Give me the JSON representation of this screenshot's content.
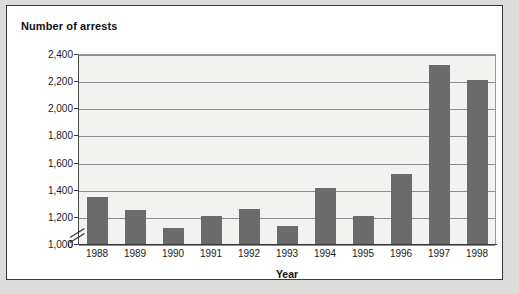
{
  "chart_data": {
    "type": "bar",
    "title": "Number of arrests",
    "xlabel": "Year",
    "ylabel": "",
    "categories": [
      "1988",
      "1989",
      "1990",
      "1991",
      "1992",
      "1993",
      "1994",
      "1995",
      "1996",
      "1997",
      "1998"
    ],
    "values": [
      1350,
      1250,
      1120,
      1205,
      1255,
      1130,
      1410,
      1210,
      1515,
      2320,
      2210
    ],
    "ylim": [
      1000,
      2400
    ],
    "y_axis_broken": true,
    "y_break_from": 0,
    "y_break_to": 1000,
    "ytick_labels": [
      "2,400",
      "2,200",
      "2,000",
      "1,800",
      "1,600",
      "1,400",
      "1,200",
      "1,000",
      "0"
    ],
    "ytick_values": [
      2400,
      2200,
      2000,
      1800,
      1600,
      1400,
      1200,
      1000,
      0
    ],
    "grid": true,
    "legend": "none",
    "series_color": "#6b6b6b",
    "plot_background": "#f2f2f0",
    "gridline_color": "#8c8c8c"
  }
}
